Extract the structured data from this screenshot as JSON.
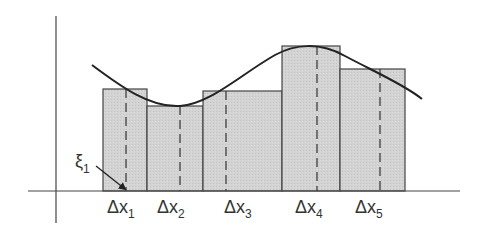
{
  "diagram": {
    "type": "riemann-sum",
    "colors": {
      "axis": "#444444",
      "curve": "#222222",
      "rect_fill": "#d2d2d2",
      "rect_stroke": "#444444",
      "dash": "#333333",
      "text": "#333333"
    },
    "axes": {
      "y_axis": {
        "x": 56,
        "y1": 16,
        "y2": 223
      },
      "x_axis": {
        "y": 191,
        "x1": 28,
        "x2": 460
      }
    },
    "rectangles": [
      {
        "x0": 103,
        "x1": 147,
        "top": 89,
        "sample_x": 126
      },
      {
        "x0": 147,
        "x1": 203,
        "top": 106,
        "sample_x": 180
      },
      {
        "x0": 203,
        "x1": 282,
        "top": 91,
        "sample_x": 226
      },
      {
        "x0": 282,
        "x1": 340,
        "top": 46,
        "sample_x": 317
      },
      {
        "x0": 340,
        "x1": 405,
        "top": 69,
        "sample_x": 380
      }
    ],
    "curve_path": "M 92 65 C 120 86, 150 108, 180 106 C 210 104, 240 75, 275 55 C 295 44, 320 42, 345 56 C 375 72, 405 85, 422 99",
    "labels": [
      {
        "id": "dx1",
        "main": "Δx",
        "sub": "1",
        "x": 107,
        "y": 213
      },
      {
        "id": "dx2",
        "main": "Δx",
        "sub": "2",
        "x": 157,
        "y": 213
      },
      {
        "id": "dx3",
        "main": "Δx",
        "sub": "3",
        "x": 224,
        "y": 213
      },
      {
        "id": "dx4",
        "main": "Δx",
        "sub": "4",
        "x": 295,
        "y": 213
      },
      {
        "id": "dx5",
        "main": "Δx",
        "sub": "5",
        "x": 355,
        "y": 213
      }
    ],
    "xi_label": {
      "main": "ξ",
      "sub": "1",
      "x": 75,
      "y": 167
    },
    "xi_arrow": {
      "x1": 96,
      "y1": 166,
      "x2": 125,
      "y2": 189
    }
  }
}
